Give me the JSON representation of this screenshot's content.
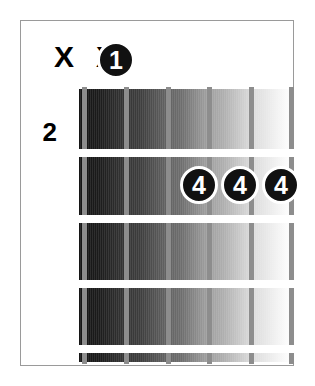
{
  "diagram": {
    "kind": "guitar-chord-diagram",
    "fret_position_label": "2",
    "string_count": 6,
    "fret_count": 4,
    "mute_markers": [
      {
        "label": "X",
        "string": 1
      },
      {
        "label": "X",
        "string": 2
      }
    ],
    "finger_dots": [
      {
        "label": "1",
        "string": 3,
        "fret": 1
      },
      {
        "label": "4",
        "string": 4,
        "fret": 3
      },
      {
        "label": "4",
        "string": 5,
        "fret": 3
      },
      {
        "label": "4",
        "string": 6,
        "fret": 3
      }
    ],
    "colors": {
      "dot_fill": "#111111",
      "dot_text": "#ffffff",
      "dot_ring": "#ffffff",
      "fret_line": "#ffffff",
      "string": "#8d8d8d",
      "border": "#9a9a9a",
      "background": "#ffffff",
      "board_dark": "#151515",
      "board_light": "#ffffff"
    }
  }
}
